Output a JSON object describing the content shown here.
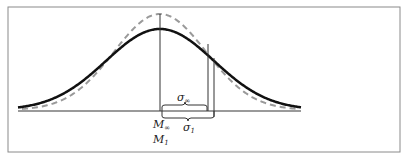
{
  "diagram": {
    "type": "normal-distribution-comparison",
    "curves": [
      {
        "id": "sample-1",
        "style": "solid",
        "color": "#111111",
        "mean_label": "M₁",
        "sd_label": "σ₁"
      },
      {
        "id": "population",
        "style": "dashed",
        "color": "#9a9a9a",
        "mean_label": "M∞",
        "sd_label": "σ∞"
      }
    ],
    "labels": {
      "mean_inf": "M",
      "mean_inf_sub": "∞",
      "mean_1": "M",
      "mean_1_sub": "1",
      "sigma_inf": "σ",
      "sigma_inf_sub": "∞",
      "sigma_1": "σ",
      "sigma_1_sub": "1"
    },
    "colors": {
      "frame": "#8a8a8a",
      "baseline": "#9a9a9a",
      "solid_curve": "#111111",
      "dashed_curve": "#9a9a9a",
      "markers": "#333333"
    }
  }
}
